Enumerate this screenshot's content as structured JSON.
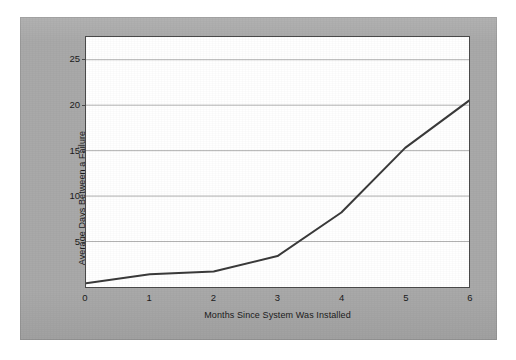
{
  "figure": {
    "background_color": "#ffffff",
    "mat_color": "#a9a9a9",
    "panel_color": "#ffffff",
    "axis_color": "#4a4a4a",
    "grid_color": "#b0b0b0",
    "line_color": "#3a3a3a"
  },
  "chart_data": {
    "type": "line",
    "title": "",
    "subtitle": "",
    "xlabel": "Months Since System Was Installed",
    "ylabel": "Average Days Between a Failure",
    "x": [
      0,
      1,
      2,
      3,
      4,
      5,
      6
    ],
    "values": [
      0.4,
      1.4,
      1.7,
      3.4,
      8.2,
      15.3,
      20.5
    ],
    "series": [
      {
        "name": "Average Days Between a Failure",
        "values": [
          0.4,
          1.4,
          1.7,
          3.4,
          8.2,
          15.3,
          20.5
        ]
      }
    ],
    "xlim": [
      0,
      6
    ],
    "ylim": [
      0,
      27.5
    ],
    "xticks": [
      0,
      1,
      2,
      3,
      4,
      5,
      6
    ],
    "xtick_labels": [
      "0",
      "1",
      "2",
      "3",
      "4",
      "5",
      "6"
    ],
    "yticks": [
      5,
      10,
      15,
      20,
      25
    ],
    "ytick_labels": [
      "5",
      "10",
      "15",
      "20",
      "25"
    ],
    "grid": "horizontal",
    "grid_on": true,
    "legend": false,
    "legend_position": "none",
    "markers": false,
    "line_width_px": 2,
    "annotations": []
  }
}
